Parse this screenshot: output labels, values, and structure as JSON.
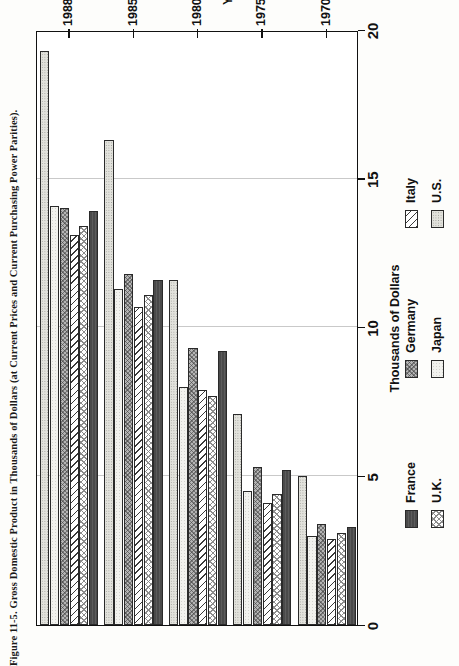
{
  "caption": "Figure 11-5. Gross Domestic Product in Thousands of Dollars (at Current Prices and Current Purchasing Power Parities).",
  "axes": {
    "value_axis_title": "Thousands of Dollars",
    "category_axis_title": "Year",
    "value_ticks": [
      "0",
      "5",
      "10",
      "15",
      "20"
    ],
    "category_ticks": [
      "1970",
      "1975",
      "1980",
      "1985",
      "1988"
    ]
  },
  "legend": {
    "entries": [
      {
        "label": "France",
        "pattern": "p-france"
      },
      {
        "label": "U.K.",
        "pattern": "p-uk"
      },
      {
        "label": "Germany",
        "pattern": "p-germany"
      },
      {
        "label": "Japan",
        "pattern": "p-japan"
      },
      {
        "label": "Italy",
        "pattern": "p-italy"
      },
      {
        "label": "U.S.",
        "pattern": "p-us"
      }
    ]
  },
  "chart_data": {
    "type": "bar",
    "orientation": "horizontal",
    "title": "Figure 11-5. Gross Domestic Product in Thousands of Dollars (at Current Prices and Current Purchasing Power Parities).",
    "xlabel": "Thousands of Dollars",
    "ylabel": "Year",
    "xlim": [
      0,
      20
    ],
    "xticks": [
      0,
      5,
      10,
      15,
      20
    ],
    "grid": true,
    "legend_position": "below",
    "categories": [
      "1970",
      "1975",
      "1980",
      "1985",
      "1988"
    ],
    "series": [
      {
        "name": "France",
        "values": [
          3.3,
          5.2,
          9.2,
          11.6,
          13.9
        ]
      },
      {
        "name": "U.K.",
        "values": [
          3.1,
          4.4,
          7.7,
          11.1,
          13.4
        ]
      },
      {
        "name": "Italy",
        "values": [
          2.9,
          4.1,
          7.9,
          10.7,
          13.1
        ]
      },
      {
        "name": "Germany",
        "values": [
          3.4,
          5.3,
          9.3,
          11.8,
          14.0
        ]
      },
      {
        "name": "Japan",
        "values": [
          3.0,
          4.5,
          8.0,
          11.3,
          14.1
        ]
      },
      {
        "name": "U.S.",
        "values": [
          5.0,
          7.1,
          11.6,
          16.3,
          19.3
        ]
      }
    ]
  }
}
